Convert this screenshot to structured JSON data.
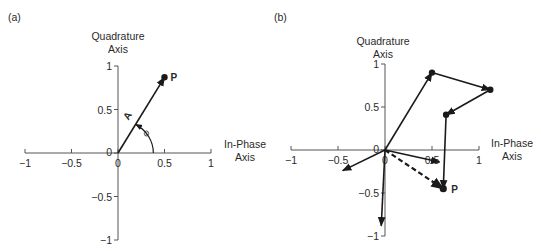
{
  "colors": {
    "ink": "#1a1a1a",
    "axis": "#555555",
    "background": "#ffffff"
  },
  "panels": [
    {
      "id": "a",
      "label": "(a)",
      "y_axis_title": [
        "Quadrature",
        "Axis"
      ],
      "x_axis_title": [
        "In-Phase",
        "Axis"
      ],
      "origin_px": [
        118,
        153
      ],
      "scale_px": [
        93,
        87
      ],
      "x_ticks": [
        "-1",
        "-0.5",
        "0",
        "0.5",
        "1"
      ],
      "y_ticks": [
        "1",
        "0.5",
        "0",
        "-0.5",
        "-1"
      ],
      "vector_label": "A",
      "angle_label": "φ",
      "point_label": "P"
    },
    {
      "id": "b",
      "label": "(b)",
      "y_axis_title": [
        "Quadrature",
        "Axis"
      ],
      "x_axis_title": [
        "In-Phase",
        "Axis"
      ],
      "origin_px": [
        385,
        150
      ],
      "scale_px": [
        94,
        86
      ],
      "x_ticks": [
        "-1",
        "-0.5",
        "0",
        "0.5",
        "1"
      ],
      "y_ticks": [
        "1",
        "0.5",
        "0",
        "-0.5",
        "-1"
      ],
      "point_label": "P"
    }
  ],
  "chart_data": [
    {
      "type": "phasor-diagram",
      "title": "(a)",
      "xlabel": "In-Phase Axis",
      "ylabel": "Quadrature Axis",
      "xlim": [
        -1,
        1
      ],
      "ylim": [
        -1,
        1
      ],
      "x_ticks": [
        -1,
        -0.5,
        0,
        0.5,
        1
      ],
      "y_ticks": [
        -1,
        -0.5,
        0,
        0.5,
        1
      ],
      "grid": false,
      "vectors": [
        {
          "from": [
            0,
            0
          ],
          "to": [
            0.5,
            0.87
          ],
          "label": "A",
          "style": "solid"
        }
      ],
      "points": [
        {
          "x": 0.5,
          "y": 0.87,
          "label": "P"
        }
      ],
      "annotations": [
        {
          "type": "angle-arc",
          "label": "φ",
          "radius": 0.38,
          "from_deg": 0,
          "to_deg": 60
        }
      ]
    },
    {
      "type": "phasor-diagram",
      "title": "(b)",
      "xlabel": "In-Phase Axis",
      "ylabel": "Quadrature Axis",
      "xlim": [
        -1,
        1
      ],
      "ylim": [
        -1,
        1
      ],
      "x_ticks": [
        -1,
        -0.5,
        0,
        0.5,
        1
      ],
      "y_ticks": [
        -1,
        -0.5,
        0,
        0.5,
        1
      ],
      "grid": false,
      "chain": [
        [
          0,
          0
        ],
        [
          0.5,
          0.9
        ],
        [
          1.12,
          0.7
        ],
        [
          0.65,
          0.41
        ],
        [
          0.62,
          -0.45
        ]
      ],
      "vectors_from_origin": [
        {
          "to": [
            -0.45,
            -0.24
          ],
          "style": "solid"
        },
        {
          "to": [
            -0.04,
            -0.88
          ],
          "style": "solid"
        },
        {
          "to": [
            0.58,
            -0.14
          ],
          "style": "solid"
        },
        {
          "to": [
            0.62,
            -0.45
          ],
          "style": "dashed",
          "label": "resultant"
        }
      ],
      "points": [
        {
          "x": 0.62,
          "y": -0.45,
          "label": "P"
        }
      ]
    }
  ]
}
